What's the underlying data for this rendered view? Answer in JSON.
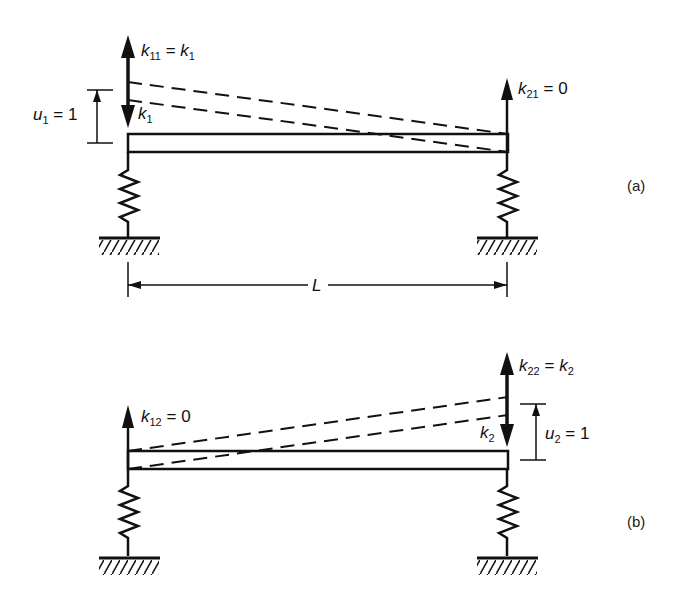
{
  "figure": {
    "panels": [
      {
        "id": "a",
        "tag": "(a)",
        "left_force": {
          "symbol": "k",
          "sub": "11",
          "eq": "=",
          "rhs_symbol": "k",
          "rhs_sub": "1"
        },
        "left_reaction": {
          "symbol": "k",
          "sub": "1"
        },
        "right_force": {
          "symbol": "k",
          "sub": "21",
          "eq": "=",
          "rhs": "0"
        },
        "displacement": {
          "symbol": "u",
          "sub": "1",
          "eq": "=",
          "value": "1"
        },
        "span_label": "L"
      },
      {
        "id": "b",
        "tag": "(b)",
        "left_force": {
          "symbol": "k",
          "sub": "12",
          "eq": "=",
          "rhs": "0"
        },
        "right_force": {
          "symbol": "k",
          "sub": "22",
          "eq": "=",
          "rhs_symbol": "k",
          "rhs_sub": "2"
        },
        "right_reaction": {
          "symbol": "k",
          "sub": "2"
        },
        "displacement": {
          "symbol": "u",
          "sub": "2",
          "eq": "=",
          "value": "1"
        }
      }
    ],
    "colors": {
      "ink": "#111111",
      "background": "#ffffff"
    }
  }
}
